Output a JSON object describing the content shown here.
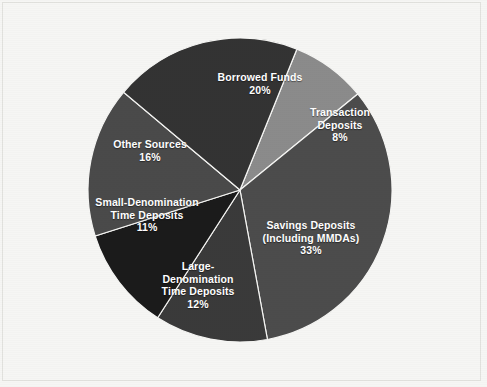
{
  "chart_data": {
    "type": "pie",
    "title": "",
    "subtitle": "",
    "xlabel": "",
    "ylabel": "",
    "legend_position": "none",
    "grid": false,
    "units": "percent",
    "total": 100,
    "center": {
      "x": 240,
      "y": 190
    },
    "radius": 152,
    "start_angle_deg": -68,
    "direction": "clockwise",
    "categories": [
      "Transaction Deposits",
      "Savings Deposits (Including MMDAs)",
      "Large-Denomination Time Deposits",
      "Small-Denomination Time Deposits",
      "Other Sources",
      "Borrowed Funds"
    ],
    "values": [
      8,
      33,
      12,
      11,
      16,
      20
    ],
    "slices": [
      {
        "id": "transaction-deposits",
        "label_lines": [
          "Transaction",
          "Deposits"
        ],
        "percent_text": "8%",
        "value": 8,
        "color": "#8b8b8b",
        "label_x": 340,
        "label_y": 125
      },
      {
        "id": "savings-deposits",
        "label_lines": [
          "Savings Deposits",
          "(Including MMDAs)"
        ],
        "percent_text": "33%",
        "value": 33,
        "color": "#4c4c4c",
        "label_x": 311,
        "label_y": 238
      },
      {
        "id": "large-denomination-time-deposits",
        "label_lines": [
          "Large-",
          "Denomination",
          "Time Deposits"
        ],
        "percent_text": "12%",
        "value": 12,
        "color": "#3a3a3a",
        "label_x": 198,
        "label_y": 285
      },
      {
        "id": "small-denomination-time-deposits",
        "label_lines": [
          "Small-Denomination",
          "Time Deposits"
        ],
        "percent_text": "11%",
        "value": 11,
        "color": "#1b1b1b",
        "label_x": 147,
        "label_y": 215
      },
      {
        "id": "other-sources",
        "label_lines": [
          "Other Sources"
        ],
        "percent_text": "16%",
        "value": 16,
        "color": "#4a4a4a",
        "label_x": 150,
        "label_y": 150
      },
      {
        "id": "borrowed-funds",
        "label_lines": [
          "Borrowed Funds"
        ],
        "percent_text": "20%",
        "value": 20,
        "color": "#333333",
        "label_x": 260,
        "label_y": 83
      }
    ],
    "colors": {
      "background": "#f6f6f4",
      "label_text": "#ffffff",
      "slice_separator": "#f6f6f4"
    }
  }
}
